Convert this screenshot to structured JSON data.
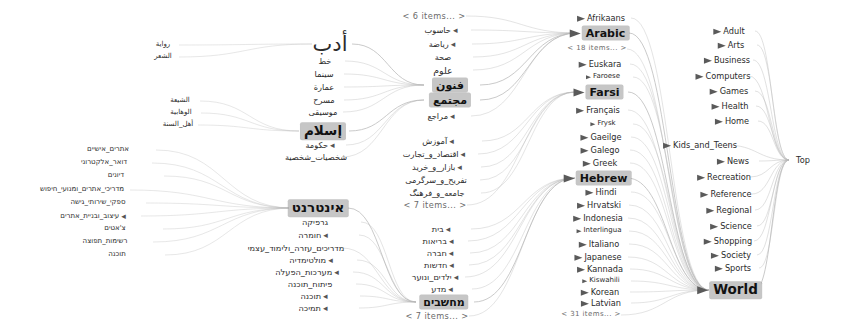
{
  "view": {
    "type": "hyperbolic-tree",
    "title": "Open Directory hierarchy browser",
    "root_label": "Top",
    "highlight_color": "#c6c6c6",
    "background_color": "#ffffff",
    "edge_color": "#b9b9b9"
  },
  "root": {
    "label": "Top",
    "x": 803,
    "y": 160
  },
  "top_categories": [
    {
      "label": "Adult",
      "x": 729,
      "y": 31,
      "size": "f8"
    },
    {
      "label": "Arts",
      "x": 731,
      "y": 45,
      "size": "f8"
    },
    {
      "label": "Business",
      "x": 727,
      "y": 60,
      "size": "f8"
    },
    {
      "label": "Computers",
      "x": 723,
      "y": 76,
      "size": "f8"
    },
    {
      "label": "Games",
      "x": 729,
      "y": 91,
      "size": "f8"
    },
    {
      "label": "Health",
      "x": 730,
      "y": 106,
      "size": "f8"
    },
    {
      "label": "Home",
      "x": 732,
      "y": 121,
      "size": "f8"
    },
    {
      "label": "Kids_and_Teens",
      "x": 700,
      "y": 145,
      "size": "f8"
    },
    {
      "label": "News",
      "x": 733,
      "y": 161,
      "size": "f8"
    },
    {
      "label": "Recreation",
      "x": 724,
      "y": 177,
      "size": "f8"
    },
    {
      "label": "Reference",
      "x": 726,
      "y": 194,
      "size": "f8"
    },
    {
      "label": "Regional",
      "x": 729,
      "y": 210,
      "size": "f8"
    },
    {
      "label": "Science",
      "x": 731,
      "y": 226,
      "size": "f8"
    },
    {
      "label": "Shopping",
      "x": 728,
      "y": 241,
      "size": "f8"
    },
    {
      "label": "Society",
      "x": 731,
      "y": 255,
      "size": "f8"
    },
    {
      "label": "Sports",
      "x": 733,
      "y": 268,
      "size": "f8"
    },
    {
      "label": "World",
      "x": 729,
      "y": 290,
      "size": "f13",
      "highlight": true
    }
  ],
  "world_languages": [
    {
      "label": "Afrikaans",
      "x": 601,
      "y": 18,
      "size": "f8"
    },
    {
      "label": "Arabic",
      "x": 599,
      "y": 33,
      "size": "f11",
      "highlight": true
    },
    {
      "label": "< 18 items... >",
      "x": 597,
      "y": 49,
      "size": "f7",
      "items_marker": true
    },
    {
      "label": "Euskara",
      "x": 600,
      "y": 64,
      "size": "f8"
    },
    {
      "label": "Faroese",
      "x": 603,
      "y": 77,
      "size": "f7"
    },
    {
      "label": "Farsi",
      "x": 598,
      "y": 92,
      "size": "f11",
      "highlight": true
    },
    {
      "label": "Français",
      "x": 598,
      "y": 110,
      "size": "f8"
    },
    {
      "label": "Frysk",
      "x": 603,
      "y": 124,
      "size": "f7"
    },
    {
      "label": "Gaeilge",
      "x": 601,
      "y": 137,
      "size": "f8"
    },
    {
      "label": "Galego",
      "x": 600,
      "y": 150,
      "size": "f8"
    },
    {
      "label": "Greek",
      "x": 600,
      "y": 163,
      "size": "f8"
    },
    {
      "label": "Hebrew",
      "x": 597,
      "y": 178,
      "size": "f11",
      "highlight": true
    },
    {
      "label": "Hindi",
      "x": 601,
      "y": 192,
      "size": "f8"
    },
    {
      "label": "Hrvatski",
      "x": 599,
      "y": 205,
      "size": "f8"
    },
    {
      "label": "Indonesia",
      "x": 598,
      "y": 218,
      "size": "f8"
    },
    {
      "label": "Interlingua",
      "x": 599,
      "y": 231,
      "size": "f7"
    },
    {
      "label": "Italiano",
      "x": 599,
      "y": 244,
      "size": "f8"
    },
    {
      "label": "Japanese",
      "x": 598,
      "y": 257,
      "size": "f8"
    },
    {
      "label": "Kannada",
      "x": 600,
      "y": 269,
      "size": "f8"
    },
    {
      "label": "Kiswahili",
      "x": 601,
      "y": 281,
      "size": "f7"
    },
    {
      "label": "Korean",
      "x": 600,
      "y": 292,
      "size": "f8"
    },
    {
      "label": "Latvian",
      "x": 601,
      "y": 303,
      "size": "f8"
    },
    {
      "label": "< 31 items... >",
      "x": 591,
      "y": 315,
      "size": "f7",
      "items_marker": true
    }
  ],
  "arabic_branch": {
    "items_top": {
      "label": "< 6 items... >",
      "x": 434,
      "y": 16
    },
    "children": [
      {
        "label": "حاسوب",
        "x": 441,
        "y": 30,
        "size": "f8",
        "dot": true
      },
      {
        "label": "رياضة",
        "x": 442,
        "y": 44,
        "size": "f8",
        "dot": true
      },
      {
        "label": "صحة",
        "x": 443,
        "y": 57,
        "size": "f8"
      },
      {
        "label": "علوم",
        "x": 443,
        "y": 70,
        "size": "f9"
      },
      {
        "label": "فنون",
        "x": 450,
        "y": 85,
        "size": "f11",
        "highlight": true
      },
      {
        "label": "مجتمع",
        "x": 450,
        "y": 100,
        "size": "f11",
        "highlight": true
      },
      {
        "label": "مراجع",
        "x": 441,
        "y": 116,
        "size": "f8",
        "dot": true
      }
    ]
  },
  "farsi_branch": {
    "children": [
      {
        "label": "آموزش",
        "x": 438,
        "y": 141,
        "size": "f8",
        "dot": true
      },
      {
        "label": "اقتصاد_و_تجارت",
        "x": 434,
        "y": 154,
        "size": "f8",
        "dot": true
      },
      {
        "label": "بازار_و_خرید",
        "x": 437,
        "y": 167,
        "size": "f8",
        "dot": true
      },
      {
        "label": "تفریح_و_سرگرمی",
        "x": 436,
        "y": 180,
        "size": "f8"
      },
      {
        "label": "جامعه_و_فرهنگ",
        "x": 437,
        "y": 193,
        "size": "f8"
      }
    ],
    "items_bottom": {
      "label": "< 7 items... >",
      "x": 435,
      "y": 205
    }
  },
  "hebrew_branch": {
    "children": [
      {
        "label": "בית",
        "x": 441,
        "y": 229,
        "size": "f8",
        "dot": true
      },
      {
        "label": "בריאות",
        "x": 438,
        "y": 241,
        "size": "f8",
        "dot": true
      },
      {
        "label": "חברה",
        "x": 440,
        "y": 253,
        "size": "f8",
        "dot": true
      },
      {
        "label": "חדשות",
        "x": 439,
        "y": 265,
        "size": "f8",
        "dot": true
      },
      {
        "label": "ילדים_ונוער",
        "x": 435,
        "y": 277,
        "size": "f8",
        "dot": true
      },
      {
        "label": "מדע",
        "x": 442,
        "y": 289,
        "size": "f8",
        "dot": true
      },
      {
        "label": "מחשבים",
        "x": 444,
        "y": 302,
        "size": "f11",
        "highlight": true
      }
    ],
    "items_bottom": {
      "label": "< 7 items... >",
      "x": 437,
      "y": 316
    }
  },
  "arabic_arts": {
    "parent": {
      "label": "أدب",
      "x": 330,
      "y": 44,
      "size": "f21"
    },
    "children": [
      {
        "label": "خط",
        "x": 325,
        "y": 61,
        "size": "f8"
      },
      {
        "label": "سينما",
        "x": 324,
        "y": 74,
        "size": "f8"
      },
      {
        "label": "عمارة",
        "x": 324,
        "y": 87,
        "size": "f8"
      },
      {
        "label": "مسرح",
        "x": 324,
        "y": 100,
        "size": "f8"
      },
      {
        "label": "موسيقى",
        "x": 323,
        "y": 112,
        "size": "f8"
      }
    ]
  },
  "arabic_society": {
    "parent": {
      "label": "إسلام",
      "x": 323,
      "y": 131,
      "size": "f13",
      "highlight": true
    },
    "children": [
      {
        "label": "حكومة",
        "x": 320,
        "y": 145,
        "size": "f8",
        "dot": true
      },
      {
        "label": "شخصيات_شخصية",
        "x": 316,
        "y": 157,
        "size": "f8"
      }
    ]
  },
  "hebrew_computers": {
    "parent": {
      "label": "אינטרנט",
      "x": 318,
      "y": 208,
      "size": "f13",
      "highlight": true
    },
    "children": [
      {
        "label": "גרפיקה",
        "x": 315,
        "y": 222,
        "size": "f8"
      },
      {
        "label": "חומרה",
        "x": 313,
        "y": 235,
        "size": "f8",
        "dot": true
      },
      {
        "label": "מדריכים_עזרה_ולימוד_עצמי",
        "x": 296,
        "y": 248,
        "size": "f8"
      },
      {
        "label": "מולטימדיה",
        "x": 311,
        "y": 260,
        "size": "f8",
        "dot": true
      },
      {
        "label": "מערכות_הפעלה",
        "x": 307,
        "y": 272,
        "size": "f8",
        "dot": true
      },
      {
        "label": "פיתוח_תוכנה",
        "x": 310,
        "y": 284,
        "size": "f8"
      },
      {
        "label": "תוכנה",
        "x": 314,
        "y": 296,
        "size": "f8",
        "dot": true
      },
      {
        "label": "תמיכה",
        "x": 313,
        "y": 308,
        "size": "f8",
        "dot": true
      }
    ]
  },
  "arabic_literature_leaves": [
    {
      "label": "رواية",
      "x": 163,
      "y": 45,
      "size": "f7"
    },
    {
      "label": "الشعر",
      "x": 163,
      "y": 57,
      "size": "f7"
    }
  ],
  "islam_leaves": [
    {
      "label": "الشيعة",
      "x": 180,
      "y": 101,
      "size": "f7"
    },
    {
      "label": "الوهابية",
      "x": 181,
      "y": 113,
      "size": "f7"
    },
    {
      "label": "أهل_السنة",
      "x": 178,
      "y": 125,
      "size": "f7"
    }
  ],
  "hebrew_internet_leaves": [
    {
      "label": "אתרים_אישיים",
      "x": 108,
      "y": 150,
      "size": "f7"
    },
    {
      "label": "דואר_אלקטרוני",
      "x": 104,
      "y": 163,
      "size": "f7"
    },
    {
      "label": "דיונים",
      "x": 116,
      "y": 176,
      "size": "f7"
    },
    {
      "label": "מדריכי_אתרים_ומנועי_חיפוש",
      "x": 82,
      "y": 190,
      "size": "f7"
    },
    {
      "label": "ספקי_שירותי_גישה",
      "x": 98,
      "y": 203,
      "size": "f7"
    },
    {
      "label": "עיצוב_ובניית_אתרים",
      "x": 93,
      "y": 216,
      "size": "f7",
      "dot": true
    },
    {
      "label": "צ'אטים",
      "x": 115,
      "y": 229,
      "size": "f7"
    },
    {
      "label": "רשימות_תפוצה",
      "x": 105,
      "y": 242,
      "size": "f7"
    },
    {
      "label": "תוכנה",
      "x": 117,
      "y": 255,
      "size": "f7"
    }
  ]
}
